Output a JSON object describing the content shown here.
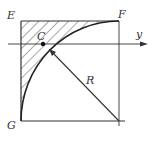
{
  "figure": {
    "labels": {
      "E": "E",
      "F": "F",
      "G": "G",
      "C": "C",
      "R": "R",
      "y_axis": "y"
    },
    "caption": "",
    "colors": {
      "line": "#333333",
      "hatch": "#444444",
      "background": "#ffffff"
    }
  }
}
